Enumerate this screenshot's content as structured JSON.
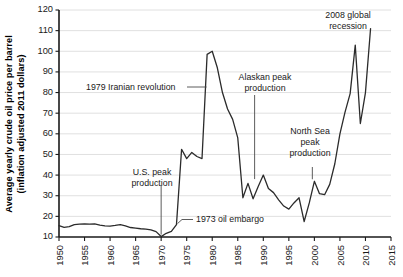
{
  "chart_data": {
    "type": "line",
    "title": "",
    "xlabel": "",
    "ylabel": "Average yearly crude oil price per barrel (inflation adjusted 2011 dollars)",
    "ylabel_line1": "Average yearly crude oil price per barrel",
    "ylabel_line2": "(inflation adjusted 2011 dollars)",
    "xlim": [
      1950,
      2015
    ],
    "ylim": [
      10,
      120
    ],
    "ytick_step": 10,
    "xtick_step": 5,
    "grid": "horizontal",
    "legend": "none",
    "yticks": [
      10,
      20,
      30,
      40,
      50,
      60,
      70,
      80,
      90,
      100,
      110,
      120
    ],
    "xticks": [
      1950,
      1955,
      1960,
      1965,
      1970,
      1975,
      1980,
      1985,
      1990,
      1995,
      2000,
      2005,
      2010,
      2015
    ],
    "series": [
      {
        "name": "Average yearly crude oil price per barrel",
        "color": "#2b2b2b",
        "x": [
          1950,
          1951,
          1952,
          1953,
          1954,
          1955,
          1956,
          1957,
          1958,
          1959,
          1960,
          1961,
          1962,
          1963,
          1964,
          1965,
          1966,
          1967,
          1968,
          1969,
          1970,
          1971,
          1972,
          1973,
          1974,
          1975,
          1976,
          1977,
          1978,
          1979,
          1980,
          1981,
          1982,
          1983,
          1984,
          1985,
          1986,
          1987,
          1988,
          1989,
          1990,
          1991,
          1992,
          1993,
          1994,
          1995,
          1996,
          1997,
          1998,
          1999,
          2000,
          2001,
          2002,
          2003,
          2004,
          2005,
          2006,
          2007,
          2008,
          2009,
          2010,
          2011
        ],
        "values": [
          15.5,
          14.7,
          15.0,
          16.0,
          16.2,
          16.3,
          16.2,
          16.4,
          15.8,
          15.4,
          15.3,
          15.6,
          16.0,
          15.4,
          14.6,
          14.3,
          14.0,
          13.8,
          13.4,
          12.6,
          10.2,
          11.8,
          12.7,
          16.0,
          52.5,
          48.0,
          51.0,
          49.0,
          48.0,
          98.5,
          100.0,
          92.0,
          80.0,
          72.0,
          67.0,
          58.0,
          29.0,
          36.0,
          28.5,
          34.5,
          40.0,
          33.5,
          31.5,
          28.0,
          25.0,
          23.5,
          26.5,
          29.0,
          17.5,
          26.5,
          37.0,
          31.0,
          30.5,
          35.5,
          45.5,
          60.0,
          70.5,
          79.5,
          103.0,
          65.0,
          80.0,
          111.0
        ]
      }
    ],
    "annotations": [
      {
        "id": "us-peak-production",
        "label_line1": "U.S. peak",
        "label_line2": "production",
        "target_year": 1970,
        "leader": "vertical-down"
      },
      {
        "id": "oil-embargo-1973",
        "label": "1973 oil embargo",
        "target_year": 1973,
        "leader": "horizontal-left"
      },
      {
        "id": "iranian-revolution-1979",
        "label": "1979 Iranian revolution",
        "target_year": 1979,
        "leader": "horizontal-right"
      },
      {
        "id": "alaskan-peak-production",
        "label_line1": "Alaskan peak",
        "label_line2": "production",
        "target_year": 1988,
        "leader": "vertical-down"
      },
      {
        "id": "north-sea-peak-production",
        "label_line1": "North Sea",
        "label_line2": "peak",
        "label_line3": "production",
        "target_year": 1999,
        "leader": "vertical-down"
      },
      {
        "id": "global-recession-2008",
        "label_line1": "2008 global",
        "label_line2": "recession",
        "target_year": 2008,
        "leader": "vertical-down"
      }
    ]
  },
  "colors": {
    "line": "#2b2b2b",
    "grid": "#d8d8d8",
    "axis": "#1a1a1a",
    "background": "#ffffff",
    "text": "#1a1a1a"
  }
}
